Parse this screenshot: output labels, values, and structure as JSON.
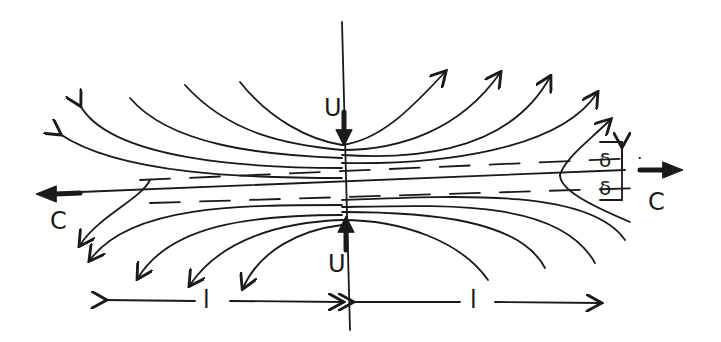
{
  "diagram": {
    "labels": {
      "u_top": "U",
      "u_bottom": "U",
      "c_left": "C",
      "c_right": "C",
      "delta_upper": "δ",
      "delta_lower": "δ",
      "l_left": "l",
      "l_right": "l"
    },
    "colors": {
      "ink": "#1a1a1a",
      "background": "#ffffff"
    }
  }
}
